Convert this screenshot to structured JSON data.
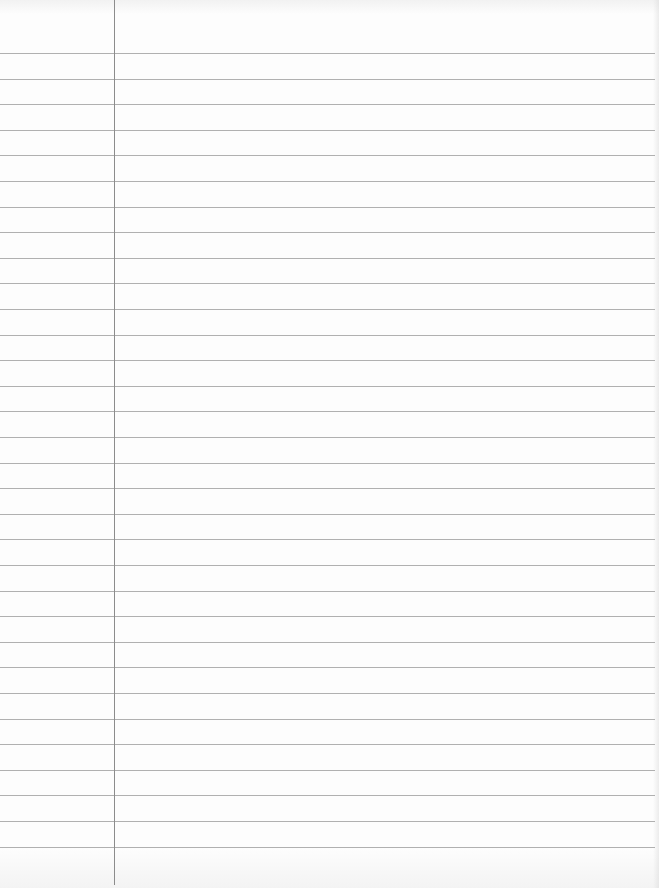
{
  "paper": {
    "type": "lined-notebook-paper",
    "background_color": "#fdfdfd",
    "rule_color": "#b0b0b0",
    "margin_line_color": "#8c8c8c",
    "rule_count": 32,
    "first_rule_y": 53,
    "rule_spacing": 25.6,
    "rule_length": 655,
    "margin_line_x": 114,
    "margin_line_length": 885
  }
}
